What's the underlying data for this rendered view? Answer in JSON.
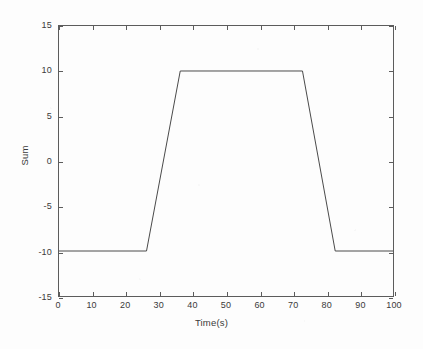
{
  "chart_data": {
    "type": "line",
    "title": "",
    "xlabel": "Time(s)",
    "ylabel": "Sum",
    "xlim": [
      0,
      100
    ],
    "ylim": [
      -15,
      15
    ],
    "xticks": [
      0,
      10,
      20,
      30,
      40,
      50,
      60,
      70,
      80,
      90,
      100
    ],
    "yticks": [
      -15,
      -10,
      -5,
      0,
      5,
      10,
      15
    ],
    "xtick_labels": [
      "0",
      "10",
      "20",
      "30",
      "40",
      "50",
      "60",
      "70",
      "80",
      "90",
      "100"
    ],
    "ytick_labels": [
      "-15",
      "-10",
      "-5",
      "0",
      "5",
      "10",
      "15"
    ],
    "grid": false,
    "legend": null,
    "series": [
      {
        "name": "Sum",
        "color": "#4a4a4a",
        "line_width": 1,
        "x": [
          0,
          26.2,
          36.3,
          72.9,
          82.7,
          100
        ],
        "y": [
          -10,
          -10,
          10,
          10,
          -10,
          -10
        ]
      }
    ],
    "annotations": []
  },
  "axes": {
    "box_color": "#5c5c5c",
    "tick_direction": "in"
  }
}
